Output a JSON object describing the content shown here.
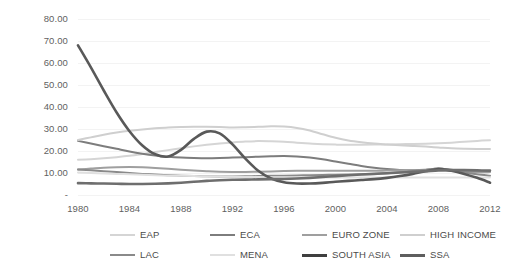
{
  "chart_data": {
    "type": "line",
    "title": "",
    "subtitle": "",
    "xlabel": "",
    "ylabel": "",
    "xlim": [
      1980,
      2012
    ],
    "ylim": [
      0,
      80
    ],
    "grid": true,
    "legend_position": "bottom",
    "x_tick_labels": [
      "1980",
      "1984",
      "1988",
      "1992",
      "1996",
      "2000",
      "2004",
      "2008",
      "2012"
    ],
    "x_ticks": [
      1980,
      1984,
      1988,
      1992,
      1996,
      2000,
      2004,
      2008,
      2012
    ],
    "y_tick_labels": [
      "80.00",
      "70.00",
      "60.00",
      "50.00",
      "40.00",
      "30.00",
      "20.00",
      "10.00",
      "-"
    ],
    "y_ticks": [
      80,
      70,
      60,
      50,
      40,
      30,
      20,
      10,
      0
    ],
    "x": [
      1980,
      1981,
      1982,
      1983,
      1984,
      1985,
      1986,
      1987,
      1988,
      1989,
      1990,
      1991,
      1992,
      1993,
      1994,
      1995,
      1996,
      1997,
      1998,
      1999,
      2000,
      2001,
      2002,
      2003,
      2004,
      2005,
      2006,
      2007,
      2008,
      2009,
      2010,
      2011,
      2012
    ],
    "series": [
      {
        "name": "EAP",
        "color": "#d5d5d5",
        "width": 2.0,
        "values": [
          16.0,
          16.3,
          16.7,
          17.2,
          17.8,
          18.6,
          19.5,
          20.4,
          21.3,
          22.1,
          22.8,
          23.4,
          23.9,
          24.3,
          24.5,
          24.4,
          24.2,
          23.8,
          23.4,
          23.1,
          22.9,
          22.8,
          22.8,
          22.9,
          23.0,
          23.1,
          23.2,
          23.3,
          23.5,
          23.8,
          24.2,
          24.6,
          24.9
        ]
      },
      {
        "name": "ECA",
        "color": "#7d7d7d",
        "width": 2.0,
        "values": [
          24.6,
          23.4,
          22.2,
          21.0,
          19.8,
          18.8,
          18.0,
          17.4,
          17.0,
          16.8,
          16.7,
          16.8,
          17.0,
          17.2,
          17.4,
          17.6,
          17.7,
          17.5,
          17.0,
          16.2,
          15.2,
          14.2,
          13.2,
          12.4,
          11.8,
          11.4,
          11.3,
          11.5,
          12.0,
          11.5,
          11.0,
          10.8,
          10.7
        ]
      },
      {
        "name": "EURO ZONE",
        "color": "#9f9f9f",
        "width": 2.0,
        "values": [
          11.6,
          12.0,
          12.4,
          12.6,
          12.7,
          12.6,
          12.3,
          11.9,
          11.5,
          11.1,
          10.8,
          10.6,
          10.5,
          10.5,
          10.6,
          10.7,
          10.9,
          11.0,
          11.0,
          11.0,
          11.0,
          11.0,
          11.0,
          11.0,
          11.1,
          11.2,
          11.2,
          11.3,
          11.4,
          11.0,
          10.6,
          10.4,
          10.4
        ]
      },
      {
        "name": "HIGH INCOME",
        "color": "#cfcfcf",
        "width": 2.0,
        "values": [
          25.0,
          26.2,
          27.4,
          28.4,
          29.2,
          29.8,
          30.3,
          30.7,
          30.9,
          31.0,
          31.0,
          30.9,
          30.7,
          30.8,
          31.0,
          31.2,
          31.1,
          30.5,
          29.3,
          27.6,
          26.0,
          24.8,
          24.0,
          23.4,
          23.0,
          22.6,
          22.3,
          22.0,
          21.6,
          21.2,
          21.0,
          20.9,
          20.9
        ]
      },
      {
        "name": "LAC",
        "color": "#8a8a8a",
        "width": 2.0,
        "values": [
          11.6,
          11.2,
          10.8,
          10.4,
          10.0,
          9.6,
          9.3,
          9.0,
          8.8,
          8.6,
          8.5,
          8.4,
          8.4,
          8.5,
          8.6,
          8.7,
          8.8,
          8.9,
          9.0,
          9.1,
          9.2,
          9.3,
          9.4,
          9.6,
          9.9,
          10.3,
          10.8,
          11.4,
          12.0,
          11.2,
          10.2,
          9.4,
          8.8
        ]
      },
      {
        "name": "MENA",
        "color": "#e0e0e0",
        "width": 2.0,
        "values": [
          10.2,
          10.0,
          9.8,
          9.6,
          9.4,
          9.2,
          9.0,
          8.8,
          8.7,
          8.6,
          8.5,
          8.4,
          8.3,
          8.2,
          8.2,
          8.1,
          8.1,
          8.0,
          8.0,
          8.0,
          8.0,
          8.0,
          8.0,
          8.0,
          8.0,
          8.0,
          8.0,
          8.0,
          8.0,
          8.0,
          8.0,
          8.0,
          8.0
        ]
      },
      {
        "name": "SOUTH ASIA",
        "color": "#595959",
        "width": 2.6,
        "values": [
          68.0,
          58.0,
          47.5,
          37.5,
          29.0,
          22.5,
          18.5,
          17.5,
          20.5,
          25.5,
          28.8,
          28.0,
          23.0,
          16.5,
          11.0,
          7.5,
          5.8,
          5.2,
          5.2,
          5.5,
          6.0,
          6.4,
          6.8,
          7.2,
          7.8,
          8.6,
          9.6,
          10.8,
          11.8,
          11.0,
          9.6,
          7.8,
          5.6
        ]
      },
      {
        "name": "SSA",
        "color": "#6e6e6e",
        "width": 2.6,
        "values": [
          5.4,
          5.3,
          5.2,
          5.1,
          5.0,
          5.0,
          5.1,
          5.3,
          5.6,
          6.0,
          6.4,
          6.7,
          6.9,
          7.0,
          7.1,
          7.2,
          7.3,
          7.5,
          7.8,
          8.2,
          8.6,
          9.0,
          9.3,
          9.6,
          9.9,
          10.2,
          10.5,
          10.8,
          11.2,
          11.3,
          11.3,
          11.2,
          11.1
        ]
      }
    ]
  },
  "legend": {
    "rows": [
      [
        {
          "label": "EAP",
          "color": "#d5d5d5",
          "width": 2.0
        },
        {
          "label": "ECA",
          "color": "#7d7d7d",
          "width": 2.0
        },
        {
          "label": "EURO ZONE",
          "color": "#9f9f9f",
          "width": 2.0
        },
        {
          "label": "HIGH INCOME",
          "color": "#cfcfcf",
          "width": 2.0
        }
      ],
      [
        {
          "label": "LAC",
          "color": "#8a8a8a",
          "width": 2.0
        },
        {
          "label": "MENA",
          "color": "#e0e0e0",
          "width": 2.0
        },
        {
          "label": "SOUTH ASIA",
          "color": "#3f3f3f",
          "width": 3.0
        },
        {
          "label": "SSA",
          "color": "#5e5e5e",
          "width": 3.0
        }
      ]
    ]
  },
  "style": {
    "background": "#ffffff",
    "gridline_color": "#f3f3f3",
    "tick_text_color": "#5f5f5f",
    "legend_text_color": "#4a4a4a"
  }
}
